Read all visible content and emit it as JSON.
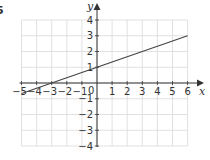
{
  "question_number": "5",
  "chart_data": {
    "type": "line",
    "title": "",
    "xlabel": "x",
    "ylabel": "y",
    "xlim": [
      -5,
      6
    ],
    "ylim": [
      -4,
      4
    ],
    "grid": true,
    "x_ticks": [
      -5,
      -4,
      -3,
      -2,
      -1,
      1,
      2,
      3,
      4,
      5,
      6
    ],
    "y_ticks": [
      -4,
      -3,
      -2,
      -1,
      1,
      2,
      3,
      4
    ],
    "origin_label": "0",
    "series": [
      {
        "name": "line",
        "equation": "y = x/3 + 1",
        "slope": 0.3333,
        "intercept": 1,
        "x": [
          -5,
          -3,
          0,
          3,
          6
        ],
        "y": [
          -0.67,
          0,
          1,
          2,
          3
        ]
      }
    ]
  },
  "colors": {
    "grid": "#d9d9d9",
    "axis": "#333333",
    "line": "#444444",
    "text": "#333333"
  },
  "layout": {
    "x0px": 97,
    "y0px": 83,
    "xunit": 15.1,
    "yunit": 15.75
  }
}
